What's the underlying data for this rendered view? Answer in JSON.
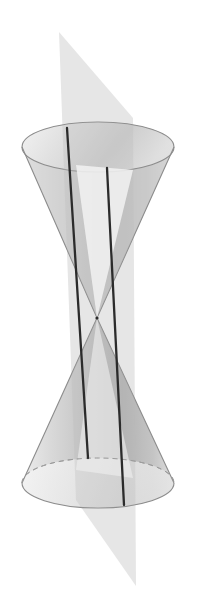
{
  "figure": {
    "title": "Double cone intersected by a plane",
    "canvas": {
      "width": 198,
      "height": 610,
      "background": "#ffffff"
    },
    "colors": {
      "background": "#ffffff",
      "cone_surface_light": "#e9e9e9",
      "cone_surface_mid": "#c9c9c9",
      "cone_surface_dark": "#b0b0b0",
      "cone_interior_light": "#f2f2f2",
      "cone_outline": "#8e8e8e",
      "plane_fill": "#e4e4e4",
      "plane_fill_over_cone": "#d0d0d0",
      "intersection_line": "#2b2b2b",
      "dashed_hidden_edge": "#9a9a9a"
    },
    "geometry": {
      "apex": {
        "x": 97,
        "y": 318
      },
      "axis_x": 98,
      "top_ellipse": {
        "cx": 98,
        "cy": 147,
        "rx": 76,
        "ry": 25
      },
      "bottom_ellipse": {
        "cx": 98,
        "cy": 483,
        "rx": 76,
        "ry": 25
      },
      "plane_band_left_x": 76,
      "plane_band_right_x": 133,
      "plane_top_apex": {
        "x": 59,
        "y": 32
      },
      "plane_top_right": {
        "x": 133,
        "y": 118
      },
      "plane_bottom_apex": {
        "x": 136,
        "y": 586
      },
      "plane_bottom_left": {
        "x": 76,
        "y": 500
      }
    },
    "elements": [
      {
        "name": "upper-nappe",
        "label": "Upper cone nappe"
      },
      {
        "name": "lower-nappe",
        "label": "Lower cone nappe"
      },
      {
        "name": "cutting-plane",
        "label": "Cutting plane through apex"
      },
      {
        "name": "intersection-line-left",
        "label": "Intersection line 1"
      },
      {
        "name": "intersection-line-right",
        "label": "Intersection line 2"
      },
      {
        "name": "apex-point",
        "label": "Apex / vertex"
      }
    ],
    "intersection_lines": [
      {
        "id": "line-left",
        "top": {
          "x": 67,
          "y": 128
        },
        "bottom": {
          "x": 88,
          "y": 458
        },
        "note": "passes through apex"
      },
      {
        "id": "line-right",
        "top": {
          "x": 107,
          "y": 168
        },
        "bottom": {
          "x": 124,
          "y": 505
        },
        "note": "passes through apex"
      }
    ]
  }
}
